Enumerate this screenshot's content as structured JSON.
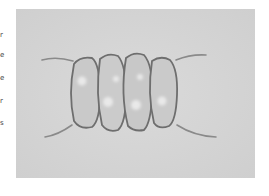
{
  "figure": {
    "background_color": "#d6d6d6",
    "cell_count": 4
  },
  "left_text_fragments": [
    "r",
    "e",
    "e",
    "r",
    "s"
  ]
}
